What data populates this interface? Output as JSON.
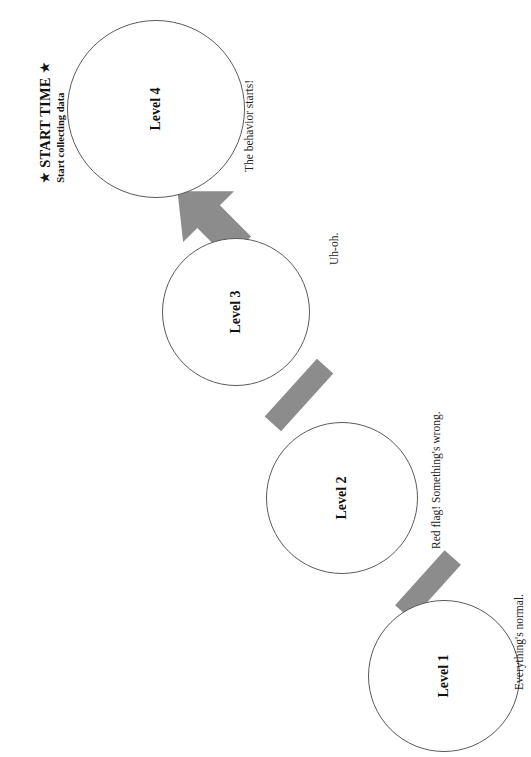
{
  "heading": {
    "star_left": "★",
    "star_right": "★",
    "title": "START TIME",
    "subtitle": "Start collecting data"
  },
  "diagram": {
    "type": "escalation-ladder",
    "orientation": "rotated-90-ccw",
    "node_shape": "circle",
    "connector_color": "#8c8c8c",
    "node_border_color": "#5a5a5a",
    "node_fill": "#ffffff",
    "text_color": "#111111",
    "nodes": [
      {
        "id": "level-1",
        "label": "Level 1",
        "annotation": "Everything's normal."
      },
      {
        "id": "level-2",
        "label": "Level 2",
        "annotation": "Red flag! Something's wrong."
      },
      {
        "id": "level-3",
        "label": "Level 3",
        "annotation": "Uh-oh."
      },
      {
        "id": "level-4",
        "label": "Level 4",
        "annotation": "The behavior starts!"
      }
    ],
    "connectors": [
      {
        "from": "level-1",
        "to": "level-2",
        "style": "bar"
      },
      {
        "from": "level-2",
        "to": "level-3",
        "style": "bar"
      },
      {
        "from": "level-3",
        "to": "level-4",
        "style": "arrow"
      }
    ]
  }
}
